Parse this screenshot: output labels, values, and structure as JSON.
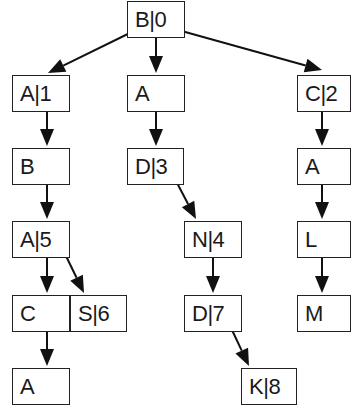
{
  "diagram": {
    "type": "trie",
    "nodes": [
      {
        "id": "n0",
        "label": "B|0",
        "x": 127,
        "y": 1,
        "w": 58
      },
      {
        "id": "n1",
        "label": "A|1",
        "x": 12,
        "y": 75,
        "w": 58
      },
      {
        "id": "n2",
        "label": "A",
        "x": 127,
        "y": 75,
        "w": 58
      },
      {
        "id": "n3",
        "label": "C|2",
        "x": 297,
        "y": 75,
        "w": 54
      },
      {
        "id": "n4",
        "label": "B",
        "x": 12,
        "y": 148,
        "w": 58
      },
      {
        "id": "n5",
        "label": "D|3",
        "x": 127,
        "y": 148,
        "w": 57
      },
      {
        "id": "n6",
        "label": "A",
        "x": 297,
        "y": 148,
        "w": 54
      },
      {
        "id": "n7",
        "label": "A|5",
        "x": 12,
        "y": 221,
        "w": 58
      },
      {
        "id": "n8",
        "label": "N|4",
        "x": 184,
        "y": 221,
        "w": 58
      },
      {
        "id": "n9",
        "label": "L",
        "x": 297,
        "y": 221,
        "w": 54
      },
      {
        "id": "n10",
        "label": "C",
        "x": 12,
        "y": 295,
        "w": 58
      },
      {
        "id": "n11",
        "label": "S|6",
        "x": 70,
        "y": 295,
        "w": 57
      },
      {
        "id": "n12",
        "label": "D|7",
        "x": 184,
        "y": 295,
        "w": 58
      },
      {
        "id": "n13",
        "label": "M",
        "x": 297,
        "y": 295,
        "w": 54
      },
      {
        "id": "n14",
        "label": "A",
        "x": 12,
        "y": 368,
        "w": 58
      },
      {
        "id": "n15",
        "label": "K|8",
        "x": 241,
        "y": 368,
        "w": 56
      }
    ],
    "edges": [
      {
        "from": "B|0",
        "to": "A|1",
        "x1": 140,
        "y1": 28,
        "x2": 48,
        "y2": 73
      },
      {
        "from": "B|0",
        "to": "A",
        "x1": 156,
        "y1": 30,
        "x2": 156,
        "y2": 73
      },
      {
        "from": "B|0",
        "to": "C|2",
        "x1": 178,
        "y1": 30,
        "x2": 322,
        "y2": 70
      },
      {
        "from": "A|1",
        "to": "B",
        "x1": 47,
        "y1": 103,
        "x2": 47,
        "y2": 146
      },
      {
        "from": "A",
        "to": "D|3",
        "x1": 156,
        "y1": 103,
        "x2": 156,
        "y2": 146
      },
      {
        "from": "C|2",
        "to": "A",
        "x1": 322,
        "y1": 103,
        "x2": 322,
        "y2": 146
      },
      {
        "from": "B",
        "to": "A|5",
        "x1": 47,
        "y1": 176,
        "x2": 47,
        "y2": 219
      },
      {
        "from": "D|3",
        "to": "N|4",
        "x1": 176,
        "y1": 181,
        "x2": 196,
        "y2": 219
      },
      {
        "from": "A",
        "to": "L",
        "x1": 322,
        "y1": 181,
        "x2": 322,
        "y2": 219
      },
      {
        "from": "A|5",
        "to": "C",
        "x1": 47,
        "y1": 250,
        "x2": 47,
        "y2": 293
      },
      {
        "from": "A|5",
        "to": "S|6",
        "x1": 66,
        "y1": 256,
        "x2": 84,
        "y2": 293
      },
      {
        "from": "N|4",
        "to": "D|7",
        "x1": 213,
        "y1": 250,
        "x2": 213,
        "y2": 293
      },
      {
        "from": "L",
        "to": "M",
        "x1": 322,
        "y1": 254,
        "x2": 322,
        "y2": 293
      },
      {
        "from": "C",
        "to": "A",
        "x1": 47,
        "y1": 331,
        "x2": 47,
        "y2": 366
      },
      {
        "from": "D|7",
        "to": "K|8",
        "x1": 232,
        "y1": 330,
        "x2": 249,
        "y2": 366
      }
    ],
    "colors": {
      "stroke": "#111111",
      "background": "#ffffff",
      "text": "#1a1a1a"
    }
  }
}
